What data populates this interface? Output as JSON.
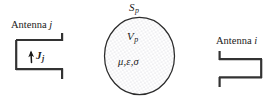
{
  "figure": {
    "width": 280,
    "height": 108,
    "background": "#ffffff",
    "stroke_color": "#333333",
    "text_color": "#1a1a1a",
    "fill_pattern": "dotted-stipple",
    "fill_dot_color": "#b9b9c4"
  },
  "antenna_left": {
    "caption_word": "Antenna",
    "caption_index": "j",
    "current_symbol": "J",
    "current_index": "j",
    "arrow_direction": "up",
    "orientation": "opens-right"
  },
  "antenna_right": {
    "caption_word": "Antenna",
    "caption_index": "i",
    "orientation": "opens-left"
  },
  "region": {
    "surface_symbol": "S",
    "surface_index": "p",
    "volume_symbol": "V",
    "volume_index": "p",
    "material_properties": "μ,ε,σ"
  }
}
